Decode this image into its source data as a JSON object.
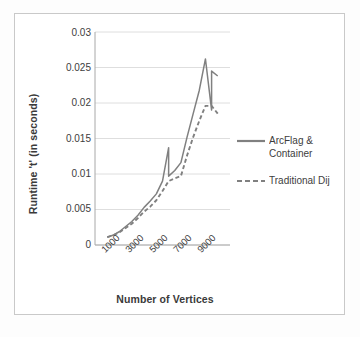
{
  "chart_data": {
    "type": "line",
    "title": "",
    "xlabel": "Number of Vertices",
    "ylabel": "Runtime 't' (in seconds)",
    "categories": [
      "1000",
      "3000",
      "5000",
      "7000",
      "9000"
    ],
    "x_tick_labels": [
      "1000",
      "3000",
      "5000",
      "7000",
      "9000"
    ],
    "y_tick_labels": [
      "0",
      "0.005",
      "0.01",
      "0.015",
      "0.02",
      "0.025",
      "0.03"
    ],
    "y_tick_values": [
      0,
      0.005,
      0.01,
      0.015,
      0.02,
      0.025,
      0.03
    ],
    "ylim": [
      0,
      0.03
    ],
    "xlim": [
      0,
      11000
    ],
    "grid": "horizontal",
    "legend_position": "right",
    "series": [
      {
        "name": "ArcFlag & Container",
        "style": "solid",
        "color": "#808080",
        "x": [
          1000,
          1500,
          2000,
          2500,
          3000,
          3500,
          4000,
          4500,
          5000,
          5500,
          6000,
          6000,
          6500,
          7000,
          7500,
          8000,
          8500,
          9000,
          9500,
          9500,
          10000
        ],
        "y": [
          0.0011,
          0.0014,
          0.0019,
          0.0026,
          0.0033,
          0.0042,
          0.0053,
          0.0062,
          0.0072,
          0.009,
          0.0137,
          0.0097,
          0.0105,
          0.0116,
          0.0152,
          0.0185,
          0.0218,
          0.0262,
          0.019,
          0.0245,
          0.0238
        ]
      },
      {
        "name": "Traditional Dij",
        "style": "dashed",
        "color": "#808080",
        "x": [
          1000,
          1500,
          2000,
          2500,
          3000,
          3500,
          4000,
          4500,
          5000,
          5500,
          6000,
          6500,
          7000,
          7500,
          8000,
          8500,
          9000,
          9500,
          10000
        ],
        "y": [
          0.0011,
          0.0014,
          0.0018,
          0.0024,
          0.003,
          0.0038,
          0.0047,
          0.0054,
          0.0063,
          0.0076,
          0.009,
          0.0094,
          0.0097,
          0.0126,
          0.0152,
          0.0175,
          0.0196,
          0.0196,
          0.0185
        ]
      }
    ]
  },
  "legend": {
    "entries": [
      {
        "label": "ArcFlag &\nContainer",
        "style": "solid"
      },
      {
        "label": "Traditional Dij",
        "style": "dashed"
      }
    ]
  },
  "colors": {
    "line": "#808080",
    "grid": "#d6d6d6",
    "axis": "#b0b0b0",
    "text": "#3d3d3d",
    "frame": "#c9c9c9",
    "background": "#ffffff"
  }
}
